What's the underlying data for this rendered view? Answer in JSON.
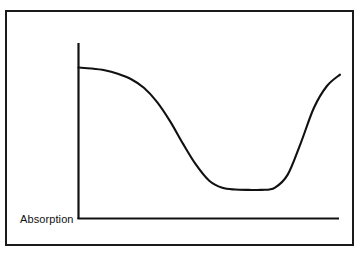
{
  "figure": {
    "background_color": "#ffffff",
    "frame_color": "#1a1a1a",
    "curve_color": "#111111",
    "axis_color": "#111111",
    "y_axis_label": "Absorption",
    "x_axis_label": "",
    "title": ""
  },
  "chart_data": {
    "type": "line",
    "title": "",
    "subtitle": "",
    "xlabel": "",
    "ylabel": "Absorption",
    "grid": false,
    "legend": [],
    "legend_position": "none",
    "axes": {
      "x_axis_shown": true,
      "y_axis_shown": true,
      "x_ticks": [],
      "y_ticks": [],
      "xlim": [
        0,
        1
      ],
      "ylim": [
        0,
        1
      ]
    },
    "annotations": [],
    "series": [
      {
        "name": "Absorption",
        "x": [
          0.0,
          0.05,
          0.1,
          0.15,
          0.2,
          0.25,
          0.3,
          0.35,
          0.4,
          0.45,
          0.5,
          0.55,
          0.6,
          0.65,
          0.7,
          0.75,
          0.8,
          0.85,
          0.9,
          0.95,
          1.0
        ],
        "y": [
          0.86,
          0.855,
          0.845,
          0.825,
          0.795,
          0.745,
          0.665,
          0.555,
          0.425,
          0.305,
          0.215,
          0.175,
          0.165,
          0.163,
          0.163,
          0.175,
          0.25,
          0.43,
          0.63,
          0.755,
          0.82
        ]
      }
    ]
  }
}
